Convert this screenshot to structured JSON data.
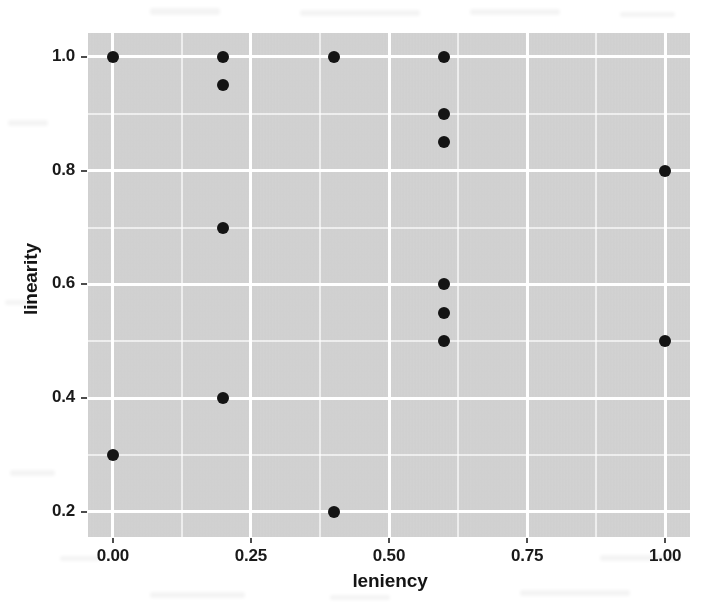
{
  "chart_data": {
    "type": "scatter",
    "title": "",
    "xlabel": "leniency",
    "ylabel": "linearity",
    "xlim": [
      -0.045,
      1.045
    ],
    "ylim": [
      0.156,
      1.042
    ],
    "grid": true,
    "legend": null,
    "x_ticks": [
      {
        "value": 0.0,
        "label": "0.00"
      },
      {
        "value": 0.25,
        "label": "0.25"
      },
      {
        "value": 0.5,
        "label": "0.50"
      },
      {
        "value": 0.75,
        "label": "0.75"
      },
      {
        "value": 1.0,
        "label": "1.00"
      }
    ],
    "y_ticks": [
      {
        "value": 0.2,
        "label": "0.2"
      },
      {
        "value": 0.4,
        "label": "0.4"
      },
      {
        "value": 0.6,
        "label": "0.6"
      },
      {
        "value": 0.8,
        "label": "0.8"
      },
      {
        "value": 1.0,
        "label": "1.0"
      }
    ],
    "x_minor_ticks": [
      0.125,
      0.375,
      0.625,
      0.875
    ],
    "y_minor_ticks": [
      0.3,
      0.5,
      0.7,
      0.9
    ],
    "points": [
      {
        "x": 0.0,
        "y": 1.0
      },
      {
        "x": 0.0,
        "y": 0.3
      },
      {
        "x": 0.2,
        "y": 1.0
      },
      {
        "x": 0.2,
        "y": 0.95
      },
      {
        "x": 0.2,
        "y": 0.7
      },
      {
        "x": 0.2,
        "y": 0.4
      },
      {
        "x": 0.4,
        "y": 1.0
      },
      {
        "x": 0.4,
        "y": 0.2
      },
      {
        "x": 0.6,
        "y": 1.0
      },
      {
        "x": 0.6,
        "y": 0.9
      },
      {
        "x": 0.6,
        "y": 0.85
      },
      {
        "x": 0.6,
        "y": 0.6
      },
      {
        "x": 0.6,
        "y": 0.55
      },
      {
        "x": 0.6,
        "y": 0.5
      },
      {
        "x": 1.0,
        "y": 0.8
      },
      {
        "x": 1.0,
        "y": 0.5
      }
    ],
    "colors": {
      "point": "#141414",
      "panel_background": "#d4d4d4",
      "grid_line": "#ffffff",
      "axis_text": "#1a1a1a",
      "figure_background": "#ffffff"
    }
  }
}
